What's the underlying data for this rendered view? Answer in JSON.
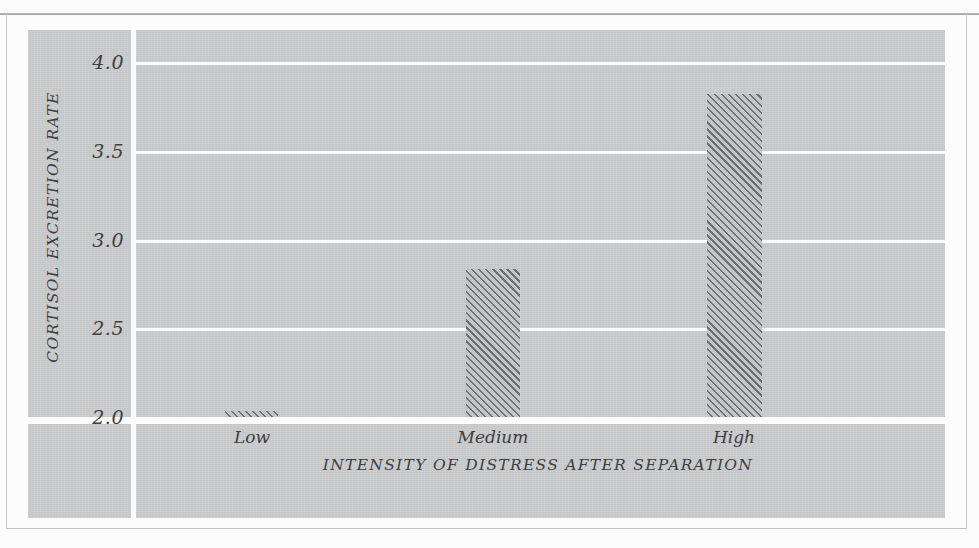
{
  "chart_data": {
    "type": "bar",
    "title": "",
    "categories": [
      "Low",
      "Medium",
      "High"
    ],
    "values": [
      2.05,
      2.85,
      3.84
    ],
    "xlabel": "INTENSITY OF DISTRESS AFTER SEPARATION",
    "ylabel": "CORTISOL EXCRETION RATE",
    "ylim": [
      2.0,
      4.2
    ],
    "yticks": [
      "2.0",
      "2.5",
      "3.0",
      "3.5",
      "4.0"
    ],
    "ytick_values": [
      2.0,
      2.5,
      3.0,
      3.5,
      4.0
    ],
    "grid": true,
    "legend": "none",
    "bar_fill": "diagonal-hatch",
    "colors": {
      "panel_background": "#c9cacb",
      "gridline": "#fafafa",
      "baseline": "#fcfcfc",
      "hatch": "#6e7072",
      "text": "#3d3f41",
      "frame": "#c2c4c6",
      "page": "#fcfcfc"
    }
  },
  "axes": {
    "y_title": "CORTISOL EXCRETION RATE",
    "x_title": "INTENSITY OF DISTRESS AFTER SEPARATION",
    "y_labels": [
      "4.0",
      "3.5",
      "3.0",
      "2.5",
      "2.0"
    ],
    "x_labels": [
      "Low",
      "Medium",
      "High"
    ]
  }
}
